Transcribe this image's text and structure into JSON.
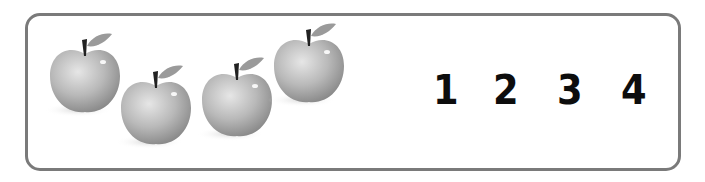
{
  "worksheet": {
    "apples": [
      {
        "label": "apple-1",
        "x": 48,
        "y": 34,
        "w": 74,
        "h": 82
      },
      {
        "label": "apple-2",
        "x": 118,
        "y": 66,
        "w": 74,
        "h": 82
      },
      {
        "label": "apple-3",
        "x": 200,
        "y": 57,
        "w": 74,
        "h": 82
      },
      {
        "label": "apple-4",
        "x": 272,
        "y": 24,
        "w": 74,
        "h": 82
      }
    ],
    "numbers": [
      "1",
      "2",
      "3",
      "4"
    ],
    "colors": {
      "border": "#7a7a7a",
      "numeral": "#0d0d0d",
      "apple_body": "#b5b5b5"
    }
  }
}
